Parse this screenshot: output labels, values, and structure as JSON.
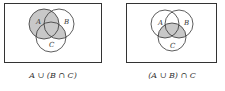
{
  "diagrams": [
    {
      "caption": "A ∪ (B ∩ C)",
      "labels": {
        "a": "A",
        "b": "B",
        "c": "C"
      },
      "shaded_region": "A ∪ (B ∩ C)"
    },
    {
      "caption": "(A ∪ B) ∩ C",
      "labels": {
        "a": "A",
        "b": "B",
        "c": "C"
      },
      "shaded_region": "(A ∪ B) ∩ C"
    }
  ],
  "colors": {
    "shade": "#c8c8c8",
    "stroke": "#333333",
    "background": "#ffffff"
  }
}
